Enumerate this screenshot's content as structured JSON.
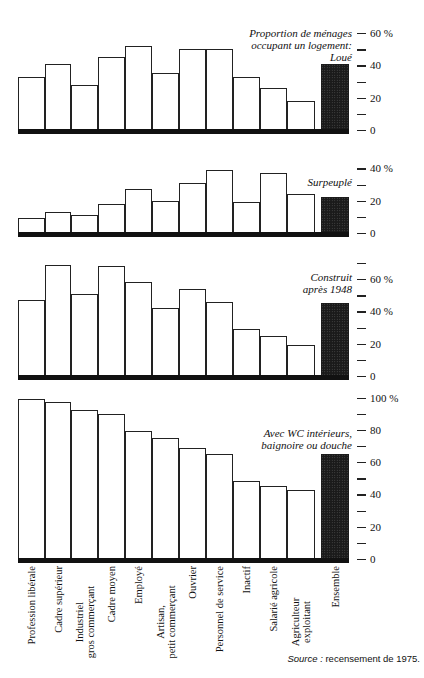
{
  "chart_data": [
    {
      "type": "bar",
      "title": "Proportion de ménages occupant un logement: Loué",
      "categories": [
        "Profession libérale",
        "Cadre supérieur",
        "Industriel gros commerçant",
        "Cadre moyen",
        "Employé",
        "Artisan, petit commerçant",
        "Ouvrier",
        "Personnel de service",
        "Inactif",
        "Salarié agricole",
        "Agriculteur exploitant",
        "Ensemble"
      ],
      "values": [
        33,
        41,
        28,
        45,
        52,
        35,
        50,
        50,
        33,
        26,
        18,
        41
      ],
      "ylabel": "%",
      "ylim": [
        0,
        60
      ],
      "yticks": [
        "0",
        "20",
        "40",
        "60 %"
      ],
      "grid": false,
      "highlight": "Ensemble"
    },
    {
      "type": "bar",
      "title": "Surpeuplé",
      "categories": [
        "Profession libérale",
        "Cadre supérieur",
        "Industriel gros commerçant",
        "Cadre moyen",
        "Employé",
        "Artisan, petit commerçant",
        "Ouvrier",
        "Personnel de service",
        "Inactif",
        "Salarié agricole",
        "Agriculteur exploitant",
        "Ensemble"
      ],
      "values": [
        9,
        13,
        11,
        18,
        27,
        20,
        31,
        39,
        19,
        37,
        24,
        22
      ],
      "ylabel": "%",
      "ylim": [
        0,
        40
      ],
      "yticks": [
        "0",
        "20",
        "40 %"
      ],
      "grid": false,
      "highlight": "Ensemble"
    },
    {
      "type": "bar",
      "title": "Construit après 1948",
      "categories": [
        "Profession libérale",
        "Cadre supérieur",
        "Industriel gros commerçant",
        "Cadre moyen",
        "Employé",
        "Artisan, petit commerçant",
        "Ouvrier",
        "Personnel de service",
        "Inactif",
        "Salarié agricole",
        "Agriculteur exploitant",
        "Ensemble"
      ],
      "values": [
        47,
        69,
        51,
        68,
        58,
        42,
        54,
        46,
        29,
        25,
        19,
        45
      ],
      "ylabel": "%",
      "ylim": [
        0,
        70
      ],
      "yticks": [
        "0",
        "20",
        "40 %",
        "60 %"
      ],
      "grid": false,
      "highlight": "Ensemble"
    },
    {
      "type": "bar",
      "title": "Avec WC intérieurs, baignoire ou douche",
      "categories": [
        "Profession libérale",
        "Cadre supérieur",
        "Industriel gros commerçant",
        "Cadre moyen",
        "Employé",
        "Artisan, petit commerçant",
        "Ouvrier",
        "Personnel de service",
        "Inactif",
        "Salarié agricole",
        "Agriculteur exploitant",
        "Ensemble"
      ],
      "values": [
        99,
        97,
        92,
        90,
        79,
        75,
        69,
        65,
        48,
        45,
        43,
        65
      ],
      "ylabel": "%",
      "ylim": [
        0,
        100
      ],
      "yticks": [
        "0",
        "20",
        "40",
        "60",
        "80",
        "100 %"
      ],
      "grid": false,
      "highlight": "Ensemble"
    }
  ],
  "panels": [
    {
      "title_lines": [
        "Proportion de ménages",
        "occupant un logement:",
        "Loué"
      ],
      "baseline_y": 130,
      "tick_step": 10,
      "max": 60,
      "labels": {
        "0": "0",
        "20": "20",
        "40": "40",
        "60": "60 %"
      }
    },
    {
      "title_lines": [
        "Surpeuplé"
      ],
      "baseline_y": 233,
      "tick_step": 10,
      "max": 40,
      "labels": {
        "0": "0",
        "20": "20",
        "40": "40 %"
      }
    },
    {
      "title_lines": [
        "Construit",
        "après 1948"
      ],
      "baseline_y": 376,
      "tick_step": 10,
      "max": 70,
      "labels": {
        "0": "0",
        "20": "20",
        "40": "40 %",
        "60": "60 %"
      }
    },
    {
      "title_lines": [
        "Avec WC intérieurs,",
        "baignoire ou douche"
      ],
      "baseline_y": 559,
      "tick_step": 10,
      "max": 100,
      "labels": {
        "0": "0",
        "20": "20",
        "40": "40",
        "60": "60",
        "80": "80",
        "100": "100 %"
      }
    }
  ],
  "x_labels": [
    [
      "Profession libérale"
    ],
    [
      "Cadre supérieur"
    ],
    [
      "Industriel",
      "gros commerçant"
    ],
    [
      "Cadre moyen"
    ],
    [
      "Employé"
    ],
    [
      "Artisan,",
      "petit commerçant"
    ],
    [
      "Ouvrier"
    ],
    [
      "Personnel de service"
    ],
    [
      "Inactif"
    ],
    [
      "Salarié agricole"
    ],
    [
      "Agriculteur",
      "exploitant"
    ],
    [
      "Ensemble"
    ]
  ],
  "source": {
    "label": "Source :",
    "text": "recensement de 1975."
  }
}
